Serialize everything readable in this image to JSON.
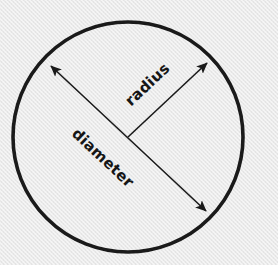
{
  "figure": {
    "background_color": "#e9e9e9",
    "stroke_color": "#1a1a1a",
    "text_color": "#161616",
    "width": 278,
    "height": 265
  },
  "circle": {
    "name": "circle-outline",
    "center_x": 128,
    "center_y": 137,
    "radius": 115,
    "stroke_width": 3.6,
    "fill": "none"
  },
  "labels": {
    "radius": "radius",
    "diameter": "diameter"
  },
  "annotations": [
    {
      "name": "radius-arrow",
      "label": "radius",
      "type": "single-headed-arrow",
      "x1": 128,
      "y1": 137,
      "x2": 207,
      "y2": 63,
      "angle_deg": -43.3,
      "stroke_width": 1.6
    },
    {
      "name": "diameter-arrow",
      "label": "diameter",
      "type": "double-headed-arrow",
      "x1": 51,
      "y1": 66,
      "x2": 206,
      "y2": 211,
      "angle_deg": 43.1,
      "stroke_width": 1.6
    }
  ]
}
